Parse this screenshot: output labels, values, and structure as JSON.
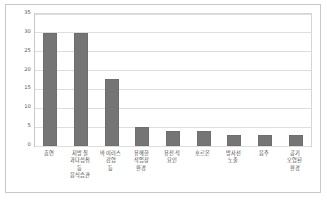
{
  "chart_data": {
    "type": "bar",
    "title": "",
    "subtitle": "",
    "xlabel": "",
    "ylabel": "",
    "categories": [
      "흡연",
      "지방질 과다섭취 등 음식습관",
      "바이러스 감염 등",
      "유해한 작업장 환경",
      "유전적 요인",
      "호르몬",
      "방사선 노출",
      "음주",
      "공기 오염된 환경"
    ],
    "category_lines": [
      [
        "흡연"
      ],
      [
        "지방질",
        "과다섭취",
        "등",
        "음식습관"
      ],
      [
        "바이러스 감염",
        "등"
      ],
      [
        "유해한",
        "작업장",
        "환경"
      ],
      [
        "유전적",
        "요인"
      ],
      [
        "호르몬"
      ],
      [
        "방사선",
        "노출"
      ],
      [
        "음주"
      ],
      [
        "공기",
        "오염된",
        "환경"
      ]
    ],
    "values": [
      30,
      30,
      17.8,
      5,
      4,
      4,
      3,
      3,
      3
    ],
    "ylim": [
      0,
      35
    ],
    "ytick_labels": [
      "0",
      "5",
      "10",
      "15",
      "20",
      "25",
      "30",
      "35"
    ],
    "ytick_values": [
      0,
      5,
      10,
      15,
      20,
      25,
      30,
      35
    ],
    "grid": true,
    "legend": false,
    "legend_position": "none",
    "bar_color": "#757575",
    "gridline_color": "#dedede",
    "frame_color": "#c9c9c9",
    "background_color": "#ffffff"
  }
}
